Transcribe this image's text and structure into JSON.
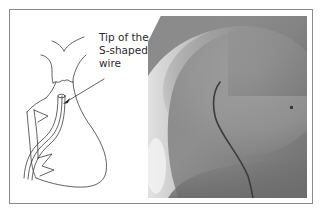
{
  "figure": {
    "left_panel": {
      "type": "line-drawing",
      "subject": "heart outline with catheter wire",
      "annotation": {
        "lines": [
          "Tip of the",
          "S-shaped",
          "wire"
        ],
        "arrow_target": "wire-tip"
      }
    },
    "right_panel": {
      "type": "fluoroscopy-image",
      "subject": "S-shaped wire in cardiac silhouette"
    },
    "colors": {
      "frame_border": "#8a8a8a",
      "line_art": "#3a3a3a",
      "text": "#2a2a2a",
      "xray_dark": "#5c5c5c",
      "xray_mid": "#8e8e8e",
      "xray_light": "#d8d8d8",
      "wire": "#3c3c3c"
    }
  }
}
